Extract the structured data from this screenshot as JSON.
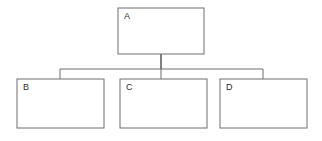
{
  "diagram": {
    "type": "tree",
    "orientation": "top-down",
    "background_color": "#ffffff",
    "line_color": "#6e6e6e",
    "text_color": "#2b2b2b",
    "box_fill": "#ffffff",
    "canvas": {
      "width": 322,
      "height": 141
    },
    "nodes": [
      {
        "id": "A",
        "label": "A",
        "level": 0,
        "x": 118,
        "y": 8,
        "width": 86,
        "height": 46,
        "label_x": 124,
        "label_y": 13
      },
      {
        "id": "B",
        "label": "B",
        "level": 1,
        "x": 17,
        "y": 79,
        "width": 87,
        "height": 49,
        "label_x": 23,
        "label_y": 84
      },
      {
        "id": "C",
        "label": "C",
        "level": 1,
        "x": 120,
        "y": 79,
        "width": 87,
        "height": 49,
        "label_x": 126,
        "label_y": 84
      },
      {
        "id": "D",
        "label": "D",
        "level": 1,
        "x": 220,
        "y": 79,
        "width": 87,
        "height": 49,
        "label_x": 226,
        "label_y": 84
      }
    ],
    "edges": [
      {
        "id": "edge-a-b",
        "from": "A",
        "to": "B",
        "path": "M 161 54 L 161 69 L 60 69 L 60 79"
      },
      {
        "id": "edge-a-c",
        "from": "A",
        "to": "C",
        "path": "M 161 54 L 161 79"
      },
      {
        "id": "edge-a-d",
        "from": "A",
        "to": "D",
        "path": "M 161 54 L 161 69 L 263 69 L 263 79"
      }
    ]
  }
}
